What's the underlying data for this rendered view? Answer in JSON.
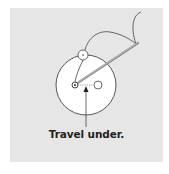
{
  "diagram": {
    "caption": "Travel under.",
    "colors": {
      "panel_background": "#e6e6e6",
      "button_fill": "#ffffff",
      "stroke": "#444444",
      "needle": "#888888",
      "caption_text": "#222222"
    },
    "elements": {
      "button": {
        "cx": 86,
        "cy": 85,
        "r": 30
      },
      "left_hole": {
        "cx": 75,
        "cy": 85,
        "r": 3
      },
      "right_hole": {
        "cx": 98,
        "cy": 85,
        "r": 4
      },
      "top_bead": {
        "cx": 83,
        "cy": 55,
        "r": 5
      },
      "arrow": {
        "from": [
          86,
          127
        ],
        "to": [
          86,
          87
        ]
      }
    }
  }
}
